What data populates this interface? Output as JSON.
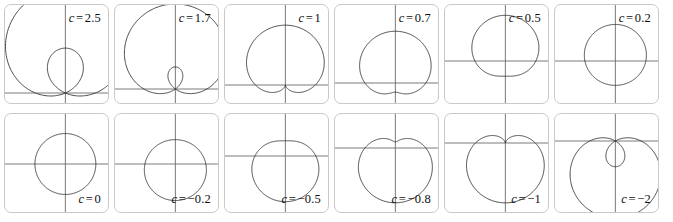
{
  "figure": {
    "rows": 2,
    "columns": 6,
    "panel_border_color": "#c9c9c9",
    "axis_color": "#6b6b6b",
    "curve_color": "#2b2b2b",
    "background_color": "#ffffff"
  },
  "chart_data": {
    "type": "line",
    "xlabel": "",
    "ylabel": "",
    "grid": false,
    "legend_position": "in-panel",
    "equation": "r = 1 + c sin(theta)",
    "panels": [
      {
        "index": 0,
        "row": 0,
        "column": 0,
        "c": 2.5,
        "label_var": "c",
        "label_eq": "=",
        "label_value": "2.5",
        "label_position": "top-right",
        "shape": "limacon with inner loop",
        "scale": 0.285,
        "origin_x": 0.575,
        "origin_y": 0.88
      },
      {
        "index": 1,
        "row": 0,
        "column": 1,
        "c": 1.7,
        "label_var": "c",
        "label_eq": "=",
        "label_value": "1.7",
        "label_position": "top-right",
        "shape": "limacon with small inner loop",
        "scale": 0.3,
        "origin_x": 0.575,
        "origin_y": 0.84
      },
      {
        "index": 2,
        "row": 0,
        "column": 2,
        "c": 1,
        "label_var": "c",
        "label_eq": "=",
        "label_value": "1",
        "label_position": "top-right",
        "shape": "cardioid",
        "scale": 0.285,
        "origin_x": 0.575,
        "origin_y": 0.8
      },
      {
        "index": 3,
        "row": 0,
        "column": 3,
        "c": 0.7,
        "label_var": "c",
        "label_eq": "=",
        "label_value": "0.7",
        "label_position": "top-right",
        "shape": "dimpled limacon",
        "scale": 0.29,
        "origin_x": 0.575,
        "origin_y": 0.78
      },
      {
        "index": 4,
        "row": 0,
        "column": 4,
        "c": 0.5,
        "label_var": "c",
        "label_eq": "=",
        "label_value": "0.5",
        "label_position": "top-right",
        "shape": "convex limacon",
        "scale": 0.29,
        "origin_x": 0.575,
        "origin_y": 0.56
      },
      {
        "index": 5,
        "row": 0,
        "column": 5,
        "c": 0.2,
        "label_var": "c",
        "label_eq": "=",
        "label_value": "0.2",
        "label_position": "top-right",
        "shape": "near-circle",
        "scale": 0.29,
        "origin_x": 0.575,
        "origin_y": 0.56
      },
      {
        "index": 6,
        "row": 1,
        "column": 0,
        "c": 0,
        "label_var": "c",
        "label_eq": "=",
        "label_value": "0",
        "label_position": "bottom-right",
        "shape": "circle",
        "scale": 0.29,
        "origin_x": 0.575,
        "origin_y": 0.5
      },
      {
        "index": 7,
        "row": 1,
        "column": 1,
        "c": -0.2,
        "label_var": "c",
        "label_eq": "=",
        "label_value": "−0.2",
        "label_position": "bottom-right",
        "shape": "near-circle",
        "scale": 0.29,
        "origin_x": 0.575,
        "origin_y": 0.5
      },
      {
        "index": 8,
        "row": 1,
        "column": 2,
        "c": -0.5,
        "label_var": "c",
        "label_eq": "=",
        "label_value": "−0.5",
        "label_position": "bottom-right",
        "shape": "convex limacon",
        "scale": 0.29,
        "origin_x": 0.575,
        "origin_y": 0.42
      },
      {
        "index": 9,
        "row": 1,
        "column": 3,
        "c": -0.8,
        "label_var": "c",
        "label_eq": "=",
        "label_value": "−0.8",
        "label_position": "bottom-right",
        "shape": "dimpled limacon",
        "scale": 0.29,
        "origin_x": 0.575,
        "origin_y": 0.34
      },
      {
        "index": 10,
        "row": 1,
        "column": 4,
        "c": -1,
        "label_var": "c",
        "label_eq": "=",
        "label_value": "−1",
        "label_position": "bottom-right",
        "shape": "inverted cardioid",
        "scale": 0.285,
        "origin_x": 0.575,
        "origin_y": 0.29
      },
      {
        "index": 11,
        "row": 1,
        "column": 5,
        "c": -2,
        "label_var": "c",
        "label_eq": "=",
        "label_value": "−2",
        "label_position": "bottom-right",
        "shape": "limacon with inner loop",
        "scale": 0.245,
        "origin_x": 0.575,
        "origin_y": 0.27
      }
    ]
  }
}
